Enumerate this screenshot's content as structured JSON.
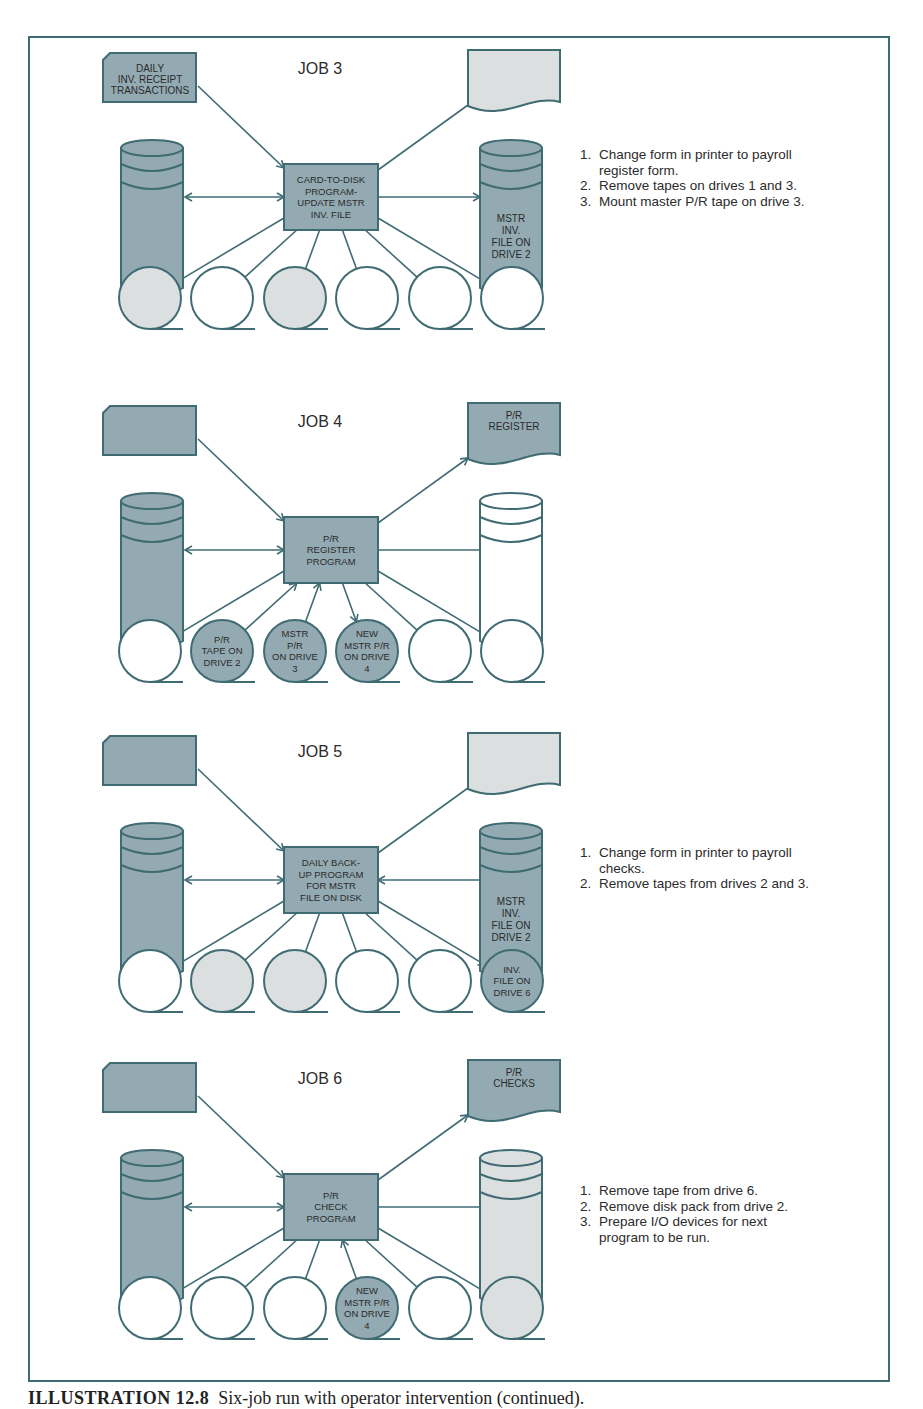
{
  "figure": {
    "caption_label": "ILLUSTRATION 12.8",
    "caption_text": "Six-job run with operator intervention (continued)."
  },
  "colors": {
    "stroke": "#3f6b73",
    "dark_fill": "#93aab2",
    "light_fill": "#dcdfdf",
    "empty_fill": "#ffffff",
    "text": "#2b2b2b"
  },
  "jobs": [
    {
      "title": "JOB 3",
      "card": {
        "label": [
          "DAILY",
          "INV. RECEIPT",
          "TRANSACTIONS"
        ],
        "fill": "dark"
      },
      "printer": {
        "label": [],
        "fill": "light"
      },
      "program": {
        "label": [
          "CARD-TO-DISK",
          "PROGRAM-",
          "UPDATE MSTR",
          "INV. FILE"
        ]
      },
      "left_disk": {
        "fill": "dark",
        "label": []
      },
      "right_disk": {
        "fill": "dark",
        "label": [
          "MSTR",
          "INV.",
          "FILE ON",
          "DRIVE 2"
        ],
        "arrow": "to-disk"
      },
      "tapes": [
        {
          "fill": "light",
          "label": [],
          "arrow": "none"
        },
        {
          "fill": "empty",
          "label": [],
          "arrow": "none"
        },
        {
          "fill": "light",
          "label": [],
          "arrow": "none"
        },
        {
          "fill": "empty",
          "label": [],
          "arrow": "none"
        },
        {
          "fill": "empty",
          "label": [],
          "arrow": "none"
        },
        {
          "fill": "empty",
          "label": [],
          "arrow": "none"
        }
      ],
      "notes": [
        {
          "num": "1.",
          "text": "Change form in printer to payroll register form."
        },
        {
          "num": "2.",
          "text": "Remove tapes on drives 1 and 3."
        },
        {
          "num": "3.",
          "text": "Mount master P/R tape on drive 3."
        }
      ]
    },
    {
      "title": "JOB 4",
      "card": {
        "label": [],
        "fill": "dark"
      },
      "printer": {
        "label": [
          "P/R",
          "REGISTER"
        ],
        "fill": "dark"
      },
      "program": {
        "label": [
          "P/R",
          "REGISTER",
          "PROGRAM"
        ]
      },
      "left_disk": {
        "fill": "dark",
        "label": []
      },
      "right_disk": {
        "fill": "empty",
        "label": [],
        "arrow": "none"
      },
      "tapes": [
        {
          "fill": "empty",
          "label": [],
          "arrow": "none"
        },
        {
          "fill": "dark",
          "label": [
            "P/R",
            "TAPE ON",
            "DRIVE 2"
          ],
          "arrow": "to-program"
        },
        {
          "fill": "dark",
          "label": [
            "MSTR",
            "P/R",
            "ON DRIVE",
            "3"
          ],
          "arrow": "to-program"
        },
        {
          "fill": "dark",
          "label": [
            "NEW",
            "MSTR P/R",
            "ON DRIVE",
            "4"
          ],
          "arrow": "to-tape"
        },
        {
          "fill": "empty",
          "label": [],
          "arrow": "none"
        },
        {
          "fill": "empty",
          "label": [],
          "arrow": "none"
        }
      ],
      "notes": []
    },
    {
      "title": "JOB 5",
      "card": {
        "label": [],
        "fill": "dark"
      },
      "printer": {
        "label": [],
        "fill": "light"
      },
      "program": {
        "label": [
          "DAILY BACK-",
          "UP PROGRAM",
          "FOR MSTR",
          "FILE ON DISK"
        ]
      },
      "left_disk": {
        "fill": "dark",
        "label": []
      },
      "right_disk": {
        "fill": "dark",
        "label": [
          "MSTR",
          "INV.",
          "FILE ON",
          "DRIVE 2"
        ],
        "arrow": "to-program"
      },
      "tapes": [
        {
          "fill": "empty",
          "label": [],
          "arrow": "none"
        },
        {
          "fill": "light",
          "label": [],
          "arrow": "none"
        },
        {
          "fill": "light",
          "label": [],
          "arrow": "none"
        },
        {
          "fill": "empty",
          "label": [],
          "arrow": "none"
        },
        {
          "fill": "empty",
          "label": [],
          "arrow": "none"
        },
        {
          "fill": "dark",
          "label": [
            "INV.",
            "FILE ON",
            "DRIVE 6"
          ],
          "arrow": "to-tape"
        }
      ],
      "notes": [
        {
          "num": "1.",
          "text": "Change form in printer to payroll checks."
        },
        {
          "num": "2.",
          "text": "Remove tapes from drives 2 and 3."
        }
      ]
    },
    {
      "title": "JOB 6",
      "card": {
        "label": [],
        "fill": "dark"
      },
      "printer": {
        "label": [
          "P/R",
          "CHECKS"
        ],
        "fill": "dark"
      },
      "program": {
        "label": [
          "P/R",
          "CHECK",
          "PROGRAM"
        ]
      },
      "left_disk": {
        "fill": "dark",
        "label": []
      },
      "right_disk": {
        "fill": "light",
        "label": [],
        "arrow": "none"
      },
      "tapes": [
        {
          "fill": "empty",
          "label": [],
          "arrow": "none"
        },
        {
          "fill": "empty",
          "label": [],
          "arrow": "none"
        },
        {
          "fill": "empty",
          "label": [],
          "arrow": "none"
        },
        {
          "fill": "dark",
          "label": [
            "NEW",
            "MSTR P/R",
            "ON DRIVE",
            "4"
          ],
          "arrow": "to-program"
        },
        {
          "fill": "empty",
          "label": [],
          "arrow": "none"
        },
        {
          "fill": "light",
          "label": [],
          "arrow": "none"
        }
      ],
      "notes": [
        {
          "num": "1.",
          "text": "Remove tape from drive 6."
        },
        {
          "num": "2.",
          "text": "Remove disk pack from drive 2."
        },
        {
          "num": "3.",
          "text": "Prepare I/O devices for next program to be run."
        }
      ]
    }
  ]
}
